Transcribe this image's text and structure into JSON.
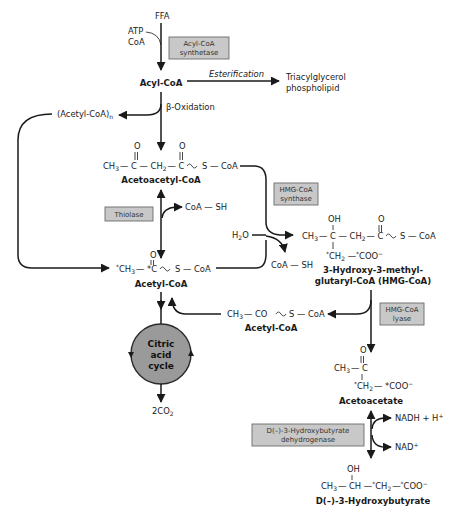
{
  "diagram": {
    "top": {
      "ffa": "FFA",
      "atp": "ATP",
      "coa": "CoA",
      "enzyme_acyl_coa_synthetase": [
        "Acyl-CoA",
        "synthetase"
      ],
      "acyl_coa": "Acyl-CoA",
      "esterification": "Esterification",
      "product_tag_1": "Triacylglycerol",
      "product_tag_2": "phospholipid",
      "beta_oxidation": "β-Oxidation",
      "acetyl_coa_n": "(Acetyl-CoA)",
      "acetyl_coa_n_sub": "n"
    },
    "acetoacetyl_coa": {
      "formula_parts": [
        "CH",
        "3",
        "— C — CH",
        "2",
        "— C",
        "S — CoA"
      ],
      "oxygen": "O",
      "name": "Acetoacetyl-CoA"
    },
    "thiolase": {
      "enzyme": "Thiolase",
      "coa_sh": "CoA — SH"
    },
    "hmg_synthase": {
      "enzyme": [
        "HMG-CoA",
        "synthase"
      ],
      "water": "H",
      "water_sub": "2",
      "water_o": "O",
      "coa_sh": "CoA — SH"
    },
    "hmg_coa": {
      "oh": "OH",
      "oxygen": "O",
      "main": "CH",
      "main_sub": "3",
      "mid": "— C — CH",
      "mid_sub": "2",
      "end": "— C",
      "thio": "S — CoA",
      "branch_ch2": "CH",
      "branch_sub": "2",
      "branch_coo": "COO",
      "name_1": "3-Hydroxy-3-methyl-",
      "name_2": "glutaryl-CoA (HMG-CoA)"
    },
    "acetyl_coa_main": {
      "ch3": "CH",
      "ch3_sub": "3",
      "c": "— *C",
      "thio": "S — CoA",
      "oxygen": "O",
      "name": "Acetyl-CoA"
    },
    "hmg_lyase": {
      "enzyme": [
        "HMG-CoA",
        "lyase"
      ],
      "acetyl_formula_a": "CH",
      "acetyl_formula_sub": "3",
      "acetyl_formula_b": "— CO",
      "acetyl_formula_c": "S — CoA",
      "acetyl_name": "Acetyl-CoA"
    },
    "citric_acid_cycle": {
      "label": [
        "Citric",
        "acid",
        "cycle"
      ],
      "output": "2CO",
      "output_sub": "2"
    },
    "acetoacetate": {
      "oxygen": "O",
      "ch3": "CH",
      "ch3_sub": "3",
      "c": "— C",
      "ch2": "CH",
      "ch2_sub": "2",
      "coo": "— *COO",
      "name": "Acetoacetate"
    },
    "hydroxybutyrate_dh": {
      "enzyme": [
        "D(–)-3-Hydroxybutyrate",
        "dehydrogenase"
      ],
      "nadh": "NADH + H",
      "nad": "NAD"
    },
    "hydroxybutyrate": {
      "oh": "OH",
      "formula_a": "CH",
      "formula_sub": "3",
      "formula_b": "— CH —",
      "formula_c": "CH",
      "formula_c_sub": "2",
      "formula_d": "—",
      "formula_e": "COO",
      "name": "D(–)-3-Hydroxybutyrate"
    }
  }
}
